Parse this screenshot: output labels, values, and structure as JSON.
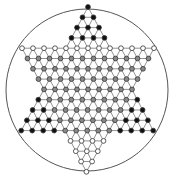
{
  "diagram": {
    "title": "",
    "type": "chinese-checkers-board",
    "rows": 17,
    "circle": {
      "cx": 87,
      "cy": 90,
      "r": 81,
      "stroke": "#555555"
    },
    "geometry": {
      "top_x": 88,
      "top_y": 7,
      "dx": 11,
      "dy": 10.3
    },
    "colors": {
      "line": "#777777",
      "black_peg": "#111111",
      "gray_peg": "#888888",
      "empty_peg": "#ffffff",
      "peg_stroke": "#333333"
    },
    "regions": {
      "top_triangle": "black",
      "lower_left_triangle": "black",
      "lower_right_triangle": "black",
      "upper_left_triangle": "empty",
      "upper_right_triangle": "empty",
      "bottom_triangle": "empty",
      "center_hexagon": "gray",
      "top_row_of_hexagon": "empty"
    }
  }
}
